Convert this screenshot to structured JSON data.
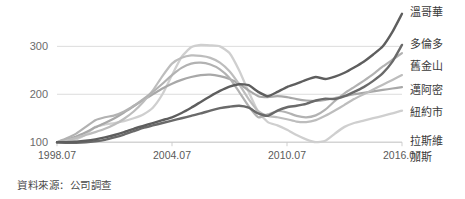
{
  "source_note": "資料來源：公司調查",
  "axes": {
    "y_ticks": [
      "100",
      "200",
      "300"
    ],
    "x_ticks": [
      "1998.07",
      "2004.07",
      "2010.07",
      "2016.07"
    ]
  },
  "legend": {
    "items": [
      {
        "label": "溫哥華",
        "color": "#5e5e5e"
      },
      {
        "label": "多倫多",
        "color": "#6a6a6a"
      },
      {
        "label": "舊金山",
        "color": "#b2b2b2"
      },
      {
        "label": "邁阿密",
        "color": "#bdbdbd"
      },
      {
        "label": "紐約市",
        "color": "#a8a8a8"
      },
      {
        "label": "拉斯維",
        "color": "#cfcfcf"
      },
      {
        "label": "加斯",
        "color": "#cfcfcf"
      }
    ]
  },
  "chart_data": {
    "type": "line",
    "title": "",
    "subtitle": "",
    "xlabel": "",
    "ylabel": "",
    "xlim": [
      1998.54,
      2016.54
    ],
    "ylim": [
      90,
      380
    ],
    "grid": true,
    "legend_position": "right",
    "annotation": "資料來源：公司調查",
    "x_tick_values": [
      1998.54,
      2004.54,
      2010.54,
      2016.54
    ],
    "x_tick_labels": [
      "1998.07",
      "2004.07",
      "2010.07",
      "2016.07"
    ],
    "y_tick_values": [
      100,
      200,
      300
    ],
    "y_tick_labels": [
      "100",
      "200",
      "300"
    ],
    "x": [
      1998.54,
      1999.04,
      1999.54,
      2000.04,
      2000.54,
      2001.04,
      2001.54,
      2002.04,
      2002.54,
      2003.04,
      2003.54,
      2004.04,
      2004.54,
      2005.04,
      2005.54,
      2006.04,
      2006.54,
      2007.04,
      2007.54,
      2008.04,
      2008.54,
      2009.04,
      2009.54,
      2010.04,
      2010.54,
      2011.04,
      2011.54,
      2012.04,
      2012.54,
      2013.04,
      2013.54,
      2014.04,
      2014.54,
      2015.04,
      2015.54,
      2016.04,
      2016.54
    ],
    "series": [
      {
        "name": "溫哥華",
        "color": "#5e5e5e",
        "width": 2.4,
        "values": [
          100,
          100,
          101,
          103,
          106,
          110,
          115,
          121,
          128,
          134,
          140,
          146,
          152,
          161,
          172,
          184,
          196,
          207,
          216,
          221,
          219,
          205,
          196,
          205,
          215,
          222,
          230,
          236,
          232,
          237,
          245,
          256,
          268,
          283,
          300,
          330,
          368
        ]
      },
      {
        "name": "多倫多",
        "color": "#6a6a6a",
        "width": 2.4,
        "values": [
          100,
          99,
          99,
          100,
          102,
          105,
          110,
          116,
          123,
          130,
          135,
          140,
          145,
          150,
          155,
          160,
          166,
          171,
          174,
          176,
          172,
          160,
          155,
          166,
          173,
          176,
          180,
          187,
          191,
          190,
          196,
          205,
          215,
          228,
          244,
          268,
          303
        ]
      },
      {
        "name": "舊金山",
        "color": "#b2b2b2",
        "width": 2.2,
        "values": [
          100,
          108,
          118,
          132,
          146,
          152,
          156,
          164,
          176,
          190,
          205,
          222,
          240,
          255,
          264,
          266,
          262,
          252,
          234,
          205,
          175,
          152,
          158,
          165,
          162,
          155,
          152,
          156,
          168,
          186,
          202,
          215,
          228,
          242,
          258,
          272,
          286
        ]
      },
      {
        "name": "邁阿密",
        "color": "#bdbdbd",
        "width": 2.2,
        "values": [
          100,
          104,
          109,
          115,
          121,
          128,
          137,
          149,
          164,
          184,
          208,
          238,
          264,
          276,
          281,
          280,
          276,
          266,
          248,
          221,
          190,
          165,
          155,
          152,
          148,
          143,
          142,
          146,
          155,
          166,
          178,
          190,
          200,
          210,
          220,
          230,
          240
        ]
      },
      {
        "name": "紐約市",
        "color": "#a8a8a8",
        "width": 2.2,
        "values": [
          100,
          105,
          112,
          121,
          131,
          140,
          150,
          162,
          175,
          188,
          200,
          212,
          222,
          230,
          236,
          240,
          241,
          238,
          232,
          222,
          208,
          196,
          194,
          196,
          194,
          190,
          187,
          186,
          188,
          192,
          196,
          200,
          203,
          206,
          209,
          212,
          215
        ]
      },
      {
        "name": "拉斯維加斯",
        "color": "#cfcfcf",
        "width": 2.3,
        "values": [
          100,
          102,
          106,
          116,
          132,
          137,
          140,
          144,
          150,
          158,
          172,
          200,
          240,
          278,
          298,
          303,
          302,
          300,
          286,
          250,
          205,
          163,
          142,
          135,
          126,
          115,
          106,
          100,
          103,
          118,
          132,
          140,
          145,
          150,
          155,
          160,
          166
        ]
      }
    ]
  }
}
